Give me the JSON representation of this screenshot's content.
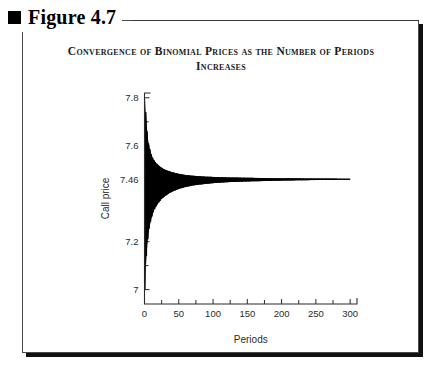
{
  "figure": {
    "bullet_icon": "black-square-icon",
    "label": "Figure 4.7"
  },
  "chart_data": {
    "type": "line",
    "title": "Convergence of Binomial Prices as the Number of Periods Increases",
    "xlabel": "Periods",
    "ylabel": "Call price",
    "xlim": [
      0,
      310
    ],
    "ylim": [
      6.94,
      7.82
    ],
    "grid": false,
    "legend": null,
    "converged_value": 7.46,
    "x_ticks": [
      0,
      50,
      100,
      150,
      200,
      250,
      300
    ],
    "x_tick_labels": [
      "0",
      "50",
      "100",
      "150",
      "200",
      "250",
      "300"
    ],
    "x_minor_ticks": [
      25,
      75,
      125,
      175,
      225,
      275
    ],
    "y_ticks": [
      7.0,
      7.2,
      7.46,
      7.6,
      7.8
    ],
    "y_tick_labels": [
      "7",
      "7.2",
      "7.46",
      "7.6",
      "7.8"
    ],
    "y_minor_ticks": [
      7.1,
      7.33,
      7.53,
      7.7
    ],
    "series": [
      {
        "name": "Binomial call price",
        "description": "Oscillating binomial option price that damps toward 7.46 as the number of periods increases",
        "x": [
          1,
          2,
          3,
          4,
          5,
          6,
          7,
          8,
          9,
          10,
          12,
          14,
          16,
          18,
          20,
          25,
          30,
          35,
          40,
          50,
          60,
          70,
          80,
          90,
          100,
          120,
          140,
          160,
          180,
          200,
          225,
          250,
          275,
          300
        ],
        "upper_envelope": [
          7.8,
          7.74,
          7.7,
          7.66,
          7.63,
          7.61,
          7.6,
          7.585,
          7.575,
          7.565,
          7.55,
          7.54,
          7.532,
          7.525,
          7.52,
          7.508,
          7.5,
          7.495,
          7.49,
          7.483,
          7.478,
          7.475,
          7.473,
          7.471,
          7.47,
          7.468,
          7.467,
          7.466,
          7.465,
          7.4645,
          7.464,
          7.4635,
          7.463,
          7.4625
        ],
        "lower_envelope": [
          7.0,
          7.09,
          7.14,
          7.18,
          7.21,
          7.235,
          7.255,
          7.27,
          7.283,
          7.295,
          7.315,
          7.33,
          7.342,
          7.352,
          7.36,
          7.378,
          7.39,
          7.4,
          7.408,
          7.42,
          7.428,
          7.434,
          7.438,
          7.441,
          7.444,
          7.448,
          7.45,
          7.452,
          7.453,
          7.4545,
          7.456,
          7.457,
          7.4575,
          7.458
        ]
      }
    ]
  }
}
